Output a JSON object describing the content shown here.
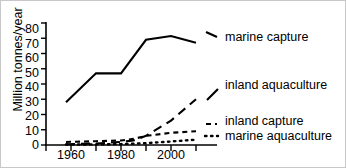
{
  "chart_data": {
    "type": "line",
    "title": "",
    "xlabel": "",
    "ylabel": "Million tonnes/year",
    "xlim": [
      1950,
      2012
    ],
    "ylim": [
      0,
      80
    ],
    "yticks": [
      80,
      70,
      60,
      50,
      40,
      30,
      20,
      10,
      0
    ],
    "xticks": [
      1950,
      1960,
      1970,
      1980,
      1990,
      2000,
      2010
    ],
    "xtick_labels": [
      "",
      "1960",
      "",
      "1980",
      "",
      "2000",
      ""
    ],
    "grid": false,
    "legend_position": "right-inline",
    "series": [
      {
        "name": "marine capture",
        "style": "solid",
        "color": "#000000",
        "x": [
          1958,
          1970,
          1980,
          1990,
          2000,
          2010
        ],
        "values": [
          28,
          47,
          47,
          69,
          71.5,
          67
        ]
      },
      {
        "name": "inland aquaculture",
        "style": "long-dash",
        "color": "#000000",
        "x": [
          1958,
          1970,
          1980,
          1985,
          1990,
          2000,
          2010
        ],
        "values": [
          0.5,
          1,
          2,
          3,
          6,
          16,
          30
        ]
      },
      {
        "name": "inland capture",
        "style": "short-dash",
        "color": "#000000",
        "x": [
          1958,
          1970,
          1980,
          1985,
          1990,
          2000,
          2010
        ],
        "values": [
          2,
          2.5,
          3,
          4,
          6,
          8,
          9
        ]
      },
      {
        "name": "marine aquaculture",
        "style": "dotted",
        "color": "#000000",
        "x": [
          1958,
          1970,
          1980,
          1990,
          2000,
          2010
        ],
        "values": [
          0.3,
          0.4,
          0.6,
          1.2,
          2.3,
          3.5
        ]
      }
    ]
  },
  "axis": {
    "y_label": "Million tonnes/year",
    "y_tick_labels": [
      "80",
      "70",
      "60",
      "50",
      "40",
      "30",
      "20",
      "10",
      "0"
    ],
    "x_tick_labels": [
      "1960",
      "1980",
      "2000"
    ]
  },
  "legend": {
    "marine_capture": "marine capture",
    "inland_aquaculture": "inland aquaculture",
    "inland_capture": "inland capture",
    "marine_aquaculture": "marine aquaculture"
  }
}
